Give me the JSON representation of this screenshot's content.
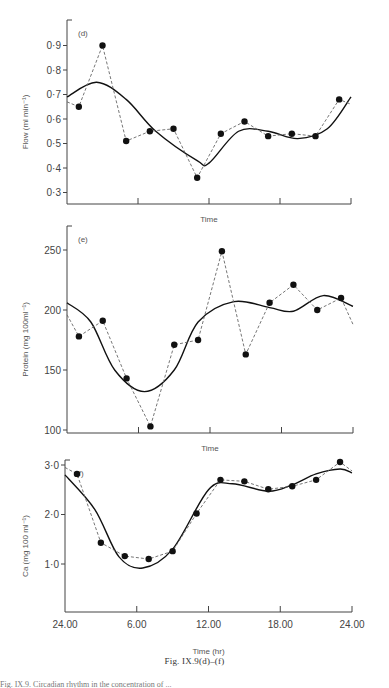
{
  "figure": {
    "caption": "Fig. IX.9(d)–(f)",
    "caption_partial_line": "Fig. IX.9. Circadian rhythm in the concentration of ..."
  },
  "chart_data": [
    {
      "type": "line",
      "panel_label": "(d)",
      "title": "",
      "xlabel": "Time",
      "ylabel": "Flow (ml min⁻¹)",
      "ylim": [
        0.25,
        1.0
      ],
      "yticks": [
        "0·3",
        "0·4",
        "0·5",
        "0·6",
        "0·7",
        "0·8",
        "0·9"
      ],
      "xlim": [
        0,
        24
      ],
      "xticks_hr": [
        0,
        6,
        12,
        18,
        24
      ],
      "grid": false,
      "series": [
        {
          "name": "observed",
          "style": "dashed+points",
          "x": [
            1.0,
            3.0,
            5.0,
            7.0,
            9.0,
            11.0,
            13.0,
            15.0,
            17.0,
            19.0,
            21.0,
            23.0
          ],
          "y": [
            0.65,
            0.9,
            0.51,
            0.55,
            0.56,
            0.36,
            0.54,
            0.59,
            0.53,
            0.54,
            0.53,
            0.68
          ]
        },
        {
          "name": "fitted",
          "style": "solid",
          "x": [
            0,
            2.5,
            5,
            7.5,
            11,
            12,
            14.5,
            17,
            19.5,
            22,
            24
          ],
          "y": [
            0.69,
            0.75,
            0.68,
            0.55,
            0.43,
            0.42,
            0.55,
            0.55,
            0.52,
            0.56,
            0.69
          ]
        }
      ]
    },
    {
      "type": "line",
      "panel_label": "(e)",
      "title": "",
      "xlabel": "Time",
      "ylabel": "Protein (mg 100ml⁻¹)",
      "ylim": [
        90,
        260
      ],
      "yticks": [
        "100",
        "150",
        "200",
        "250"
      ],
      "xlim": [
        0,
        24
      ],
      "xticks_hr": [
        0,
        6,
        12,
        18,
        24
      ],
      "grid": false,
      "series": [
        {
          "name": "observed",
          "style": "dashed+points",
          "x": [
            1.0,
            3.0,
            5.0,
            7.0,
            9.0,
            11.0,
            13.0,
            15.0,
            17.0,
            19.0,
            21.0,
            23.0
          ],
          "y": [
            178,
            191,
            143,
            103,
            171,
            175,
            249,
            163,
            206,
            221,
            200,
            210
          ]
        },
        {
          "name": "fitted",
          "style": "solid",
          "x": [
            0,
            2,
            4,
            6.5,
            9,
            11,
            14,
            17,
            19,
            21.5,
            24
          ],
          "y": [
            206,
            190,
            150,
            132,
            150,
            190,
            207,
            202,
            199,
            212,
            203
          ]
        }
      ]
    },
    {
      "type": "line",
      "panel_label": "(f)",
      "title": "",
      "xlabel": "Time (hr)",
      "ylabel": "Ca (mg 100 ml⁻¹)",
      "ylim": [
        0,
        3.1
      ],
      "yticks": [
        "1·0",
        "2·0",
        "3·0"
      ],
      "xlim": [
        0,
        24
      ],
      "xtick_labels": [
        "24.00",
        "6.00",
        "12.00",
        "18.00",
        "24.00"
      ],
      "grid": false,
      "series": [
        {
          "name": "observed",
          "style": "dashed+points",
          "x": [
            1.0,
            3.0,
            5.0,
            7.0,
            9.0,
            11.0,
            13.0,
            15.0,
            17.0,
            19.0,
            21.0,
            23.0
          ],
          "y": [
            2.82,
            1.43,
            1.16,
            1.1,
            1.26,
            2.02,
            2.7,
            2.67,
            2.51,
            2.57,
            2.7,
            3.06
          ]
        },
        {
          "name": "fitted",
          "style": "solid",
          "x": [
            0,
            2.5,
            4.5,
            6.5,
            9,
            12,
            14,
            17,
            19,
            21,
            23,
            24
          ],
          "y": [
            2.8,
            2.1,
            1.15,
            0.92,
            1.3,
            2.5,
            2.62,
            2.47,
            2.6,
            2.82,
            2.92,
            2.84
          ]
        }
      ]
    }
  ]
}
